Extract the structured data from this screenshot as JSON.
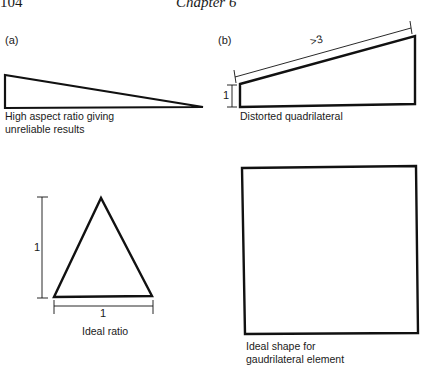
{
  "header": {
    "page_number": "104",
    "chapter": "Chapter 6"
  },
  "panels": {
    "a": {
      "label": "(a)",
      "caption_line1": "High aspect ratio giving",
      "caption_line2": "unreliable results"
    },
    "b": {
      "label": "(b)",
      "dimension_long": ">3",
      "dimension_short": "1",
      "caption": "Distorted quadrilateral"
    },
    "c": {
      "dimension_height": "1",
      "dimension_base": "1",
      "caption": "Ideal ratio"
    },
    "d": {
      "caption_line1": "Ideal shape for",
      "caption_line2": "gaudrilateral element"
    }
  }
}
